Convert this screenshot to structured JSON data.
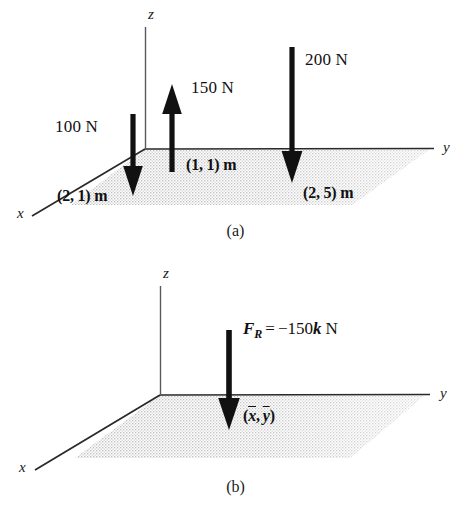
{
  "figure": {
    "colors": {
      "ink": "#1a1a1a",
      "arrow": "#111111",
      "plane_fill": "#d8d8d8",
      "background": "#ffffff"
    },
    "panels": [
      {
        "id": "a",
        "caption": "(a)",
        "axes": {
          "x": "x",
          "y": "y",
          "z": "z"
        },
        "forces": [
          {
            "name": "force-100N",
            "magnitude_label": "100 N",
            "direction": "down",
            "position_label": "(2, 1) m"
          },
          {
            "name": "force-150N",
            "magnitude_label": "150 N",
            "direction": "up",
            "position_label": "(1, 1) m"
          },
          {
            "name": "force-200N",
            "magnitude_label": "200 N",
            "direction": "down",
            "position_label": "(2, 5) m"
          }
        ]
      },
      {
        "id": "b",
        "caption": "(b)",
        "axes": {
          "x": "x",
          "y": "y",
          "z": "z"
        },
        "resultant": {
          "name": "resultant-force",
          "label_parts": {
            "symbol": "F",
            "subscript": "R",
            "equals": "=",
            "value": "−150",
            "unit_vector": "k",
            "unit": "N"
          },
          "label_plain": "F_R = −150k N",
          "direction": "down",
          "position_label_plain": "(x̄, ȳ)",
          "position_parts": {
            "open": "(",
            "x": "x",
            "comma": ",",
            "y": "y",
            "close": ")"
          }
        }
      }
    ]
  }
}
